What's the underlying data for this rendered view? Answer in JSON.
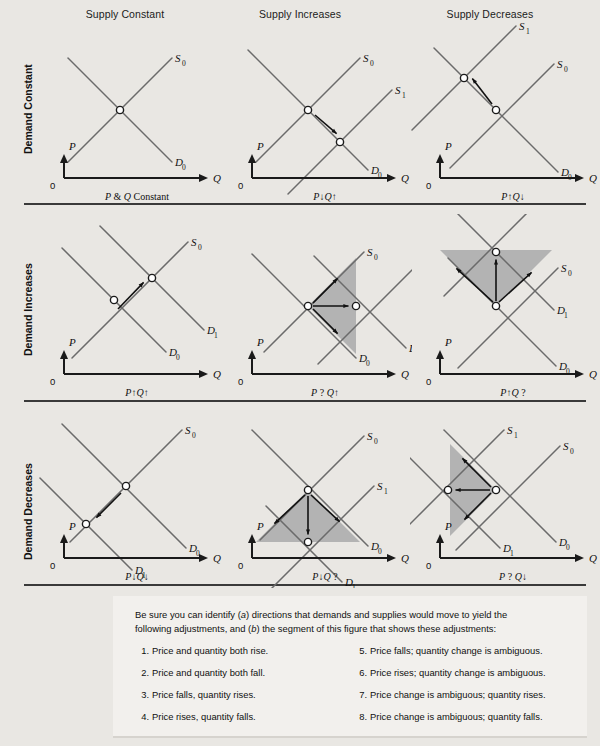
{
  "figure": {
    "background": "#e9e7e3",
    "line_color": "#6b6b6b",
    "axis_color": "#1a1a1a",
    "shade_color": "#b3b3b3",
    "shade_color_light": "#c9c9c9"
  },
  "columns": [
    {
      "id": "supply-constant",
      "label": "Supply Constant"
    },
    {
      "id": "supply-increases",
      "label": "Supply Increases"
    },
    {
      "id": "supply-decreases",
      "label": "Supply Decreases"
    }
  ],
  "rows": [
    {
      "id": "demand-constant",
      "label": "Demand Constant"
    },
    {
      "id": "demand-increases",
      "label": "Demand Increases"
    },
    {
      "id": "demand-decreases",
      "label": "Demand Decreases"
    }
  ],
  "axes": {
    "y_label": "P",
    "x_label": "Q",
    "origin_label": "0"
  },
  "curve_labels": {
    "s0": "S",
    "s0_sub": "0",
    "s1": "S",
    "s1_sub": "1",
    "d0": "D",
    "d0_sub": "0",
    "d1": "D",
    "d1_sub": "1"
  },
  "panels": [
    {
      "id": "panel-1-1",
      "row": "demand-constant",
      "col": "supply-constant",
      "footer": "P & Q Constant",
      "footer_parts": [
        {
          "t": "P",
          "i": true
        },
        {
          "t": " & ",
          "i": false
        },
        {
          "t": "Q",
          "i": true
        },
        {
          "t": " Constant",
          "i": false
        }
      ],
      "curves": [
        "S0",
        "D0"
      ],
      "equilibria": 1,
      "shaded": false,
      "arrows": 0
    },
    {
      "id": "panel-1-2",
      "row": "demand-constant",
      "col": "supply-increases",
      "footer": "P ↓ Q ↑",
      "footer_parts": [
        {
          "t": "P",
          "i": true
        },
        {
          "t": "↓",
          "i": false
        },
        {
          "t": "Q",
          "i": true
        },
        {
          "t": "↑",
          "i": false
        }
      ],
      "curves": [
        "S0",
        "S1",
        "D0"
      ],
      "equilibria": 2,
      "shaded": false,
      "arrows": 1
    },
    {
      "id": "panel-1-3",
      "row": "demand-constant",
      "col": "supply-decreases",
      "footer": "P ↑ Q ↓",
      "footer_parts": [
        {
          "t": "P",
          "i": true
        },
        {
          "t": "↑",
          "i": false
        },
        {
          "t": "Q",
          "i": true
        },
        {
          "t": "↓",
          "i": false
        }
      ],
      "curves": [
        "S1",
        "S0",
        "D0"
      ],
      "equilibria": 2,
      "shaded": false,
      "arrows": 1
    },
    {
      "id": "panel-2-1",
      "row": "demand-increases",
      "col": "supply-constant",
      "footer": "P ↑ Q ↑",
      "footer_parts": [
        {
          "t": "P",
          "i": true
        },
        {
          "t": "↑",
          "i": false
        },
        {
          "t": "Q",
          "i": true
        },
        {
          "t": "↑",
          "i": false
        }
      ],
      "curves": [
        "S0",
        "D0",
        "D1"
      ],
      "equilibria": 2,
      "shaded": false,
      "arrows": 1
    },
    {
      "id": "panel-2-2",
      "row": "demand-increases",
      "col": "supply-increases",
      "footer": "P ? Q ↑",
      "footer_parts": [
        {
          "t": "P",
          "i": true
        },
        {
          "t": " ? ",
          "i": false
        },
        {
          "t": "Q",
          "i": true
        },
        {
          "t": "↑",
          "i": false
        }
      ],
      "curves": [
        "S0",
        "S1",
        "D0",
        "D1"
      ],
      "equilibria": 2,
      "shaded": true,
      "arrows": 3
    },
    {
      "id": "panel-2-3",
      "row": "demand-increases",
      "col": "supply-decreases",
      "footer": "P ↑ Q ?",
      "footer_parts": [
        {
          "t": "P",
          "i": true
        },
        {
          "t": "↑",
          "i": false
        },
        {
          "t": "Q",
          "i": true
        },
        {
          "t": " ?",
          "i": false
        }
      ],
      "curves": [
        "S1",
        "S0",
        "D0",
        "D1"
      ],
      "equilibria": 2,
      "shaded": true,
      "arrows": 3
    },
    {
      "id": "panel-3-1",
      "row": "demand-decreases",
      "col": "supply-constant",
      "footer": "P ↓ Q ↓",
      "footer_parts": [
        {
          "t": "P",
          "i": true
        },
        {
          "t": "↓",
          "i": false
        },
        {
          "t": "Q",
          "i": true
        },
        {
          "t": "↓",
          "i": false
        }
      ],
      "curves": [
        "S0",
        "D0",
        "D1"
      ],
      "equilibria": 2,
      "shaded": false,
      "arrows": 1
    },
    {
      "id": "panel-3-2",
      "row": "demand-decreases",
      "col": "supply-increases",
      "footer": "P ↓ Q ?",
      "footer_parts": [
        {
          "t": "P",
          "i": true
        },
        {
          "t": "↓",
          "i": false
        },
        {
          "t": "Q",
          "i": true
        },
        {
          "t": " ?",
          "i": false
        }
      ],
      "curves": [
        "S0",
        "S1",
        "D0",
        "D1"
      ],
      "equilibria": 2,
      "shaded": true,
      "arrows": 3
    },
    {
      "id": "panel-3-3",
      "row": "demand-decreases",
      "col": "supply-decreases",
      "footer": "P ? Q ↓",
      "footer_parts": [
        {
          "t": "P",
          "i": true
        },
        {
          "t": " ? ",
          "i": false
        },
        {
          "t": "Q",
          "i": true
        },
        {
          "t": "↓",
          "i": false
        }
      ],
      "curves": [
        "S1",
        "S0",
        "D0",
        "D1"
      ],
      "equilibria": 2,
      "shaded": true,
      "arrows": 3
    }
  ],
  "note": {
    "intro_1": "Be sure you can identify (a) directions that demands and supplies would move to yield the",
    "intro_2": "following adjustments, and (b) the segment of this figure that shows these adjustments:",
    "items_left": [
      {
        "num": "1",
        "text": "Price and quantity both rise."
      },
      {
        "num": "2",
        "text": "Price and quantity both fall."
      },
      {
        "num": "3",
        "text": "Price falls, quantity rises."
      },
      {
        "num": "4",
        "text": "Price rises, quantity falls."
      }
    ],
    "items_right": [
      {
        "num": "5",
        "text": "Price falls; quantity change is ambiguous."
      },
      {
        "num": "6",
        "text": "Price rises; quantity change is ambiguous."
      },
      {
        "num": "7",
        "text": "Price change is ambiguous; quantity rises."
      },
      {
        "num": "8",
        "text": "Price change is ambiguous; quantity falls."
      }
    ]
  }
}
